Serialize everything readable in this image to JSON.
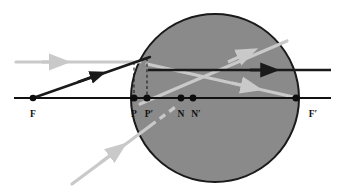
{
  "figure": {
    "kind": "optical-ray-diagram",
    "canvas": {
      "width": 339,
      "height": 196,
      "background": "#ffffff"
    }
  },
  "colors": {
    "background": "#ffffff",
    "sphere_fill": "#8a8a8a",
    "sphere_stroke": "#1a1a1a",
    "axis": "#111111",
    "dark_ray": "#1a1a1a",
    "light_ray": "#c9c9c9",
    "point_dot": "#0d0d0d",
    "dashed_guide": "#1a1a1a",
    "label_text": "#111111"
  },
  "sphere": {
    "name": "glass-sphere",
    "cx": 215,
    "cy": 98,
    "r": 84,
    "fill": "#8a8a8a",
    "stroke": "#1a1a1a",
    "stroke_width": 2
  },
  "optical_axis": {
    "name": "optical-axis",
    "y": 98,
    "x_start": 14,
    "x_end": 331
  },
  "points": [
    {
      "id": "F",
      "label": "F",
      "x": 33,
      "y": 98,
      "label_x": 33,
      "label_y": 117,
      "dot": true
    },
    {
      "id": "P",
      "label": "P",
      "x": 134,
      "y": 98,
      "label_x": 134,
      "label_y": 117,
      "dot": true
    },
    {
      "id": "Pp",
      "label": "P′",
      "x": 147,
      "y": 98,
      "label_x": 149,
      "label_y": 117,
      "dot": true
    },
    {
      "id": "N",
      "label": "N",
      "x": 181,
      "y": 98,
      "label_x": 181,
      "label_y": 117,
      "dot": true
    },
    {
      "id": "Np",
      "label": "N′",
      "x": 193,
      "y": 98,
      "label_x": 196,
      "label_y": 117,
      "dot": true
    },
    {
      "id": "Fp",
      "label": "F′",
      "x": 296,
      "y": 98,
      "label_x": 312,
      "label_y": 117,
      "dot": true
    }
  ],
  "dashed_guides": [
    {
      "name": "dashed-guide-P",
      "x": 134,
      "y_top": 62,
      "y_bottom": 98
    },
    {
      "name": "dashed-guide-Pprime",
      "x": 147,
      "y_top": 58,
      "y_bottom": 98
    }
  ],
  "rays": [
    {
      "name": "incoming-parallel-ray-light",
      "style": "light",
      "points": "16,62 134,62",
      "arrow_at": {
        "x": 58,
        "y": 62,
        "angle": 0
      }
    },
    {
      "name": "incoming-ray-from-F-dark",
      "style": "dark",
      "points": "33,98 148,58",
      "arrow_at": {
        "x": 97,
        "y": 76,
        "angle": -19
      }
    },
    {
      "name": "internal-horizontal-ray-dark",
      "style": "dark",
      "points": "148,70 331,70",
      "arrow_at": {
        "x": 272,
        "y": 70,
        "angle": 0
      }
    },
    {
      "name": "internal-ray-upward-light",
      "style": "light",
      "points": "148,98 285,42",
      "arrow_at": {
        "x": 253,
        "y": 55,
        "angle": -22
      }
    },
    {
      "name": "internal-ray-to-Fprime-light",
      "style": "light",
      "points": "148,66 296,98",
      "arrow_at": {
        "x": 253,
        "y": 88,
        "angle": 12
      }
    },
    {
      "name": "lower-incoming-ray-light",
      "style": "light",
      "points": "72,184 150,126",
      "arrow_at": {
        "x": 115,
        "y": 152,
        "angle": -37
      }
    },
    {
      "name": "lower-internal-dashed-ray-light",
      "style": "light-dashed",
      "points": "150,126 176,107",
      "arrow_at": null
    }
  ],
  "labels": {
    "F": "F",
    "P": "P",
    "P_prime": "P′",
    "N": "N",
    "N_prime": "N′",
    "F_prime": "F′"
  }
}
